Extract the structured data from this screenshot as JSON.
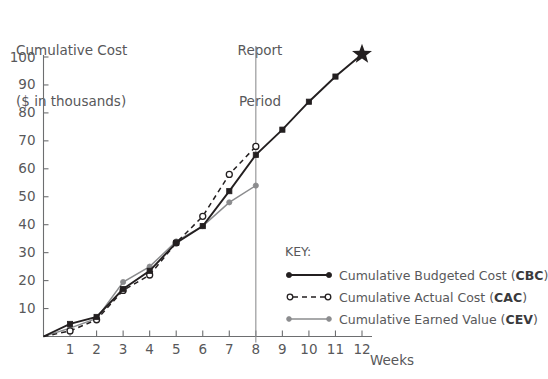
{
  "chart_data": {
    "type": "line",
    "title": "Cumulative Cost",
    "subtitle": "($ in thousands)",
    "xlabel": "Weeks",
    "ylabel": "Cumulative Cost ($ in thousands)",
    "xlim": [
      0,
      12
    ],
    "ylim": [
      0,
      100
    ],
    "xticks": [
      1,
      2,
      3,
      4,
      5,
      6,
      7,
      8,
      9,
      10,
      11,
      12
    ],
    "yticks": [
      10,
      20,
      30,
      40,
      50,
      60,
      70,
      80,
      90,
      100
    ],
    "grid": false,
    "legend_position": "inside-right",
    "x": [
      0,
      1,
      2,
      3,
      4,
      5,
      6,
      7,
      8,
      9,
      10,
      11,
      12
    ],
    "series": [
      {
        "name": "Cumulative Budgeted Cost (CBC)",
        "abbr": "CBC",
        "style": "solid",
        "color": "#231f20",
        "marker": "filled-square",
        "x": [
          0,
          1,
          2,
          3,
          4,
          5,
          6,
          7,
          8,
          9,
          10,
          11,
          12
        ],
        "values": [
          0,
          4.5,
          7,
          17,
          23.5,
          33.5,
          39.5,
          52,
          65,
          74,
          84,
          93,
          101
        ]
      },
      {
        "name": "Cumulative Actual Cost (CAC)",
        "abbr": "CAC",
        "style": "dashed",
        "color": "#231f20",
        "marker": "open-circle",
        "x": [
          0,
          1,
          2,
          3,
          4,
          5,
          6,
          7,
          8
        ],
        "values": [
          0,
          2,
          6,
          16.5,
          22,
          33.5,
          43,
          58,
          68
        ]
      },
      {
        "name": "Cumulative Earned Value (CEV)",
        "abbr": "CEV",
        "style": "solid-gray",
        "color": "#8b8c8e",
        "marker": "filled-circle",
        "x": [
          0,
          1,
          2,
          3,
          4,
          5,
          6,
          7,
          8
        ],
        "values": [
          0,
          3,
          6.5,
          19.5,
          25,
          34,
          39.5,
          48,
          54
        ]
      }
    ],
    "annotations": [
      {
        "name": "report-period-line",
        "label_line1": "Report",
        "label_line2": "Period",
        "at_x": 8
      },
      {
        "name": "project-completion-star",
        "at_x": 12,
        "at_y": 101
      }
    ]
  },
  "legend": {
    "title": "KEY:",
    "items": [
      {
        "label_prefix": "Cumulative Budgeted Cost (",
        "abbr": "CBC",
        "label_suffix": ")"
      },
      {
        "label_prefix": "Cumulative Actual Cost (",
        "abbr": "CAC",
        "label_suffix": ")"
      },
      {
        "label_prefix": "Cumulative Earned Value (",
        "abbr": "CEV",
        "label_suffix": ")"
      }
    ]
  },
  "labels": {
    "title_line1": "Cumulative Cost",
    "title_line2": "($ in thousands)",
    "report_line1": "Report",
    "report_line2": "Period",
    "weeks": "Weeks"
  },
  "colors": {
    "cbc": "#231f20",
    "cac": "#231f20",
    "cev": "#8b8c8e",
    "axis": "#6d6e70",
    "text": "#58585a",
    "report_line": "#8f9092"
  }
}
